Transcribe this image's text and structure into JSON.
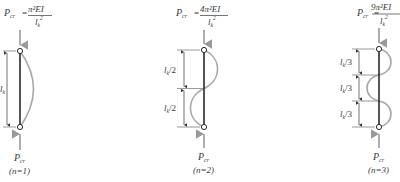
{
  "diagram": {
    "colors": {
      "column": "#2a2a2a",
      "buckled_shape": "#a8a8a8",
      "load_arrow": "#9a9a9a",
      "dimension": "#333333",
      "text": "#3a3a3a"
    },
    "cases": [
      {
        "n_label": "(n=1)",
        "formula": {
          "lhs": "P",
          "lhs_sub": "cr",
          "eq": "=",
          "numerator": "π²EI",
          "denominator": "l",
          "denominator_sub": "k",
          "denominator_sup": "2"
        },
        "bottom_load_label": "P",
        "bottom_load_sub": "cr",
        "segments": [
          {
            "label": "l",
            "sub": "k",
            "suffix": ""
          }
        ]
      },
      {
        "n_label": "(n=2)",
        "formula": {
          "lhs": "P",
          "lhs_sub": "cr",
          "eq": "=",
          "numerator": "4π²EI",
          "denominator": "l",
          "denominator_sub": "k",
          "denominator_sup": "2"
        },
        "bottom_load_label": "P",
        "bottom_load_sub": "cr",
        "segments": [
          {
            "label": "l",
            "sub": "k",
            "suffix": "/2"
          },
          {
            "label": "l",
            "sub": "k",
            "suffix": "/2"
          }
        ]
      },
      {
        "n_label": "(n=3)",
        "formula": {
          "lhs": "P",
          "lhs_sub": "cr",
          "eq": "=",
          "numerator": "9π²EI",
          "denominator": "l",
          "denominator_sub": "k",
          "denominator_sup": "2"
        },
        "bottom_load_label": "P",
        "bottom_load_sub": "cr",
        "segments": [
          {
            "label": "l",
            "sub": "k",
            "suffix": "/3"
          },
          {
            "label": "l",
            "sub": "k",
            "suffix": "/3"
          },
          {
            "label": "l",
            "sub": "k",
            "suffix": "/3"
          }
        ]
      }
    ]
  }
}
